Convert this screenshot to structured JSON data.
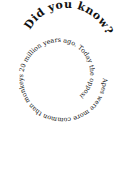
{
  "title": "Did you know?",
  "body": "Apes were more common than monkeys 20 million years ago. Today the opposite is true.",
  "colors": {
    "background": "#ffffff",
    "text": "#111111"
  }
}
